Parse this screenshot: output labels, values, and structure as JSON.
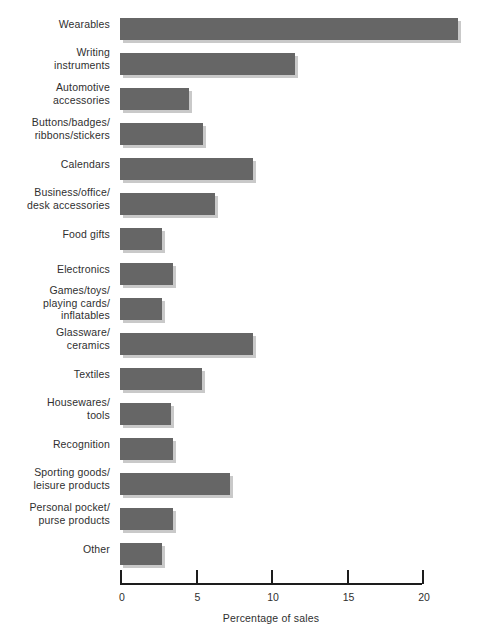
{
  "chart_data": {
    "type": "bar",
    "orientation": "horizontal",
    "title": "",
    "xlabel": "Percentage of sales",
    "ylabel": "",
    "xlim": [
      0,
      22.5
    ],
    "axis_ticks": [
      0,
      5,
      10,
      15,
      20
    ],
    "axis_tick_labels": [
      "0",
      "5",
      "10",
      "15",
      "20"
    ],
    "grid": false,
    "legend": null,
    "bar_color": "#666666",
    "shadow_color": "#c9c9c9",
    "background_color": "#ffffff",
    "categories": [
      "Wearables",
      "Writing\ninstruments",
      "Automotive\naccessories",
      "Buttons/badges/\nribbons/stickers",
      "Calendars",
      "Business/office/\ndesk accessories",
      "Food gifts",
      "Electronics",
      "Games/toys/\nplaying cards/\ninflatables",
      "Glassware/\nceramics",
      "Textiles",
      "Housewares/\ntools",
      "Recognition",
      "Sporting goods/\nleisure products",
      "Personal pocket/\npurse products",
      "Other"
    ],
    "values": [
      22.4,
      11.6,
      4.6,
      5.5,
      8.8,
      6.3,
      2.8,
      3.5,
      2.8,
      8.8,
      5.4,
      3.4,
      3.5,
      7.3,
      3.5,
      2.8
    ]
  }
}
